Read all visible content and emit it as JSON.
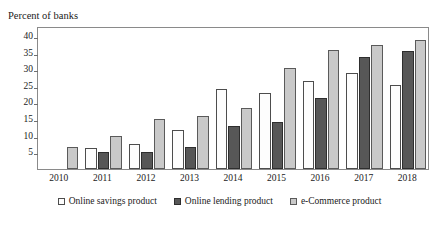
{
  "chart_data": {
    "type": "bar",
    "title": "Percent of banks",
    "xlabel": "",
    "ylabel": "",
    "ylim": [
      0,
      43
    ],
    "yticks": [
      5,
      10,
      15,
      20,
      25,
      30,
      35,
      40
    ],
    "grid": false,
    "legend_position": "bottom",
    "categories": [
      "2010",
      "2011",
      "2012",
      "2013",
      "2014",
      "2015",
      "2016",
      "2017",
      "2018"
    ],
    "series": [
      {
        "name": "Online savings product",
        "color": "#fdfdfd",
        "values": [
          null,
          6.2,
          7.6,
          11.8,
          24.0,
          23.0,
          26.5,
          28.8,
          25.4
        ]
      },
      {
        "name": "Online lending product",
        "color": "#575757",
        "values": [
          null,
          5.0,
          5.0,
          6.7,
          12.8,
          14.0,
          21.5,
          33.8,
          35.5
        ]
      },
      {
        "name": "e-Commerce product",
        "color": "#c9c9c9",
        "values": [
          6.5,
          10.0,
          15.1,
          15.8,
          18.4,
          30.5,
          35.8,
          37.2,
          38.9
        ]
      }
    ]
  }
}
